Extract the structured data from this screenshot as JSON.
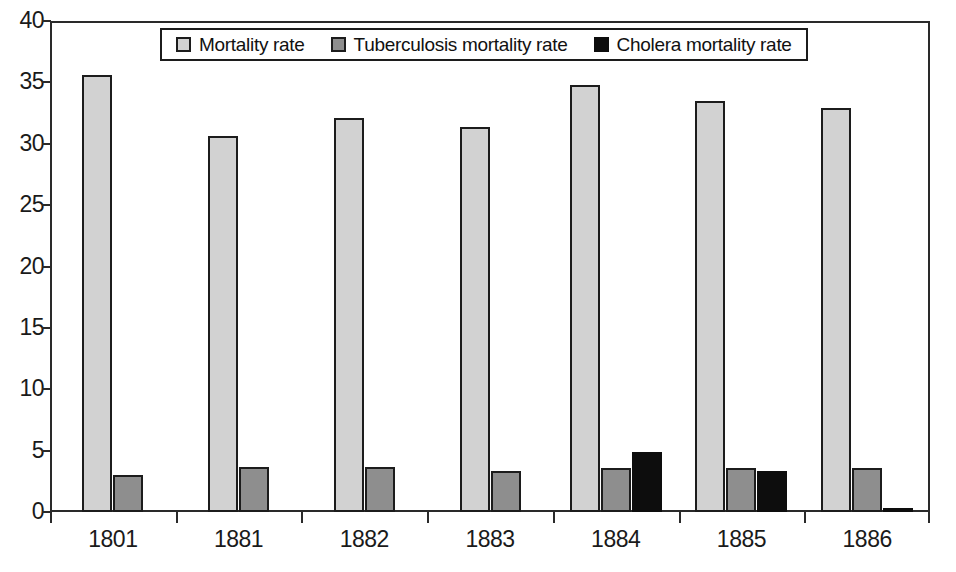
{
  "chart_data": {
    "type": "bar",
    "title": "",
    "subtitle": "",
    "xlabel": "",
    "ylabel": "",
    "categories": [
      "1801",
      "1881",
      "1882",
      "1883",
      "1884",
      "1885",
      "1886"
    ],
    "series": [
      {
        "name": "Mortality rate",
        "color": "#d2d2d2",
        "values": [
          35.6,
          30.6,
          32.1,
          31.4,
          34.8,
          33.5,
          32.9
        ]
      },
      {
        "name": "Tuberculosis mortality rate",
        "color": "#8e8e8e",
        "values": [
          3.0,
          3.65,
          3.65,
          3.35,
          3.6,
          3.6,
          3.6
        ]
      },
      {
        "name": "Cholera mortality rate",
        "color": "#0d0d0d",
        "values": [
          0,
          0,
          0,
          0,
          4.9,
          3.35,
          0.3
        ]
      }
    ],
    "ylim": [
      0,
      40
    ],
    "ytick_labels": [
      "0",
      "5",
      "10",
      "15",
      "20",
      "25",
      "30",
      "35",
      "40"
    ],
    "ytick_values": [
      0,
      5,
      10,
      15,
      20,
      25,
      30,
      35,
      40
    ],
    "grid": false,
    "legend_position": "top-center",
    "legend_entries": [
      "Mortality rate",
      "Tuberculosis mortality rate",
      "Cholera mortality rate"
    ]
  }
}
